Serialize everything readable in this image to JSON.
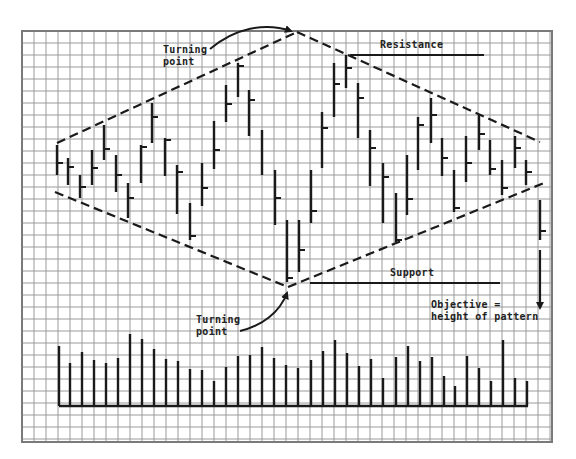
{
  "colors": {
    "grid": "#9a9a9a",
    "ink": "#1a1a1a",
    "background": "#ffffff"
  },
  "grid": {
    "left": 22,
    "top": 31,
    "right": 552,
    "bottom": 442,
    "cell": 12
  },
  "labels": {
    "turning_point_top_line1": "Turning",
    "turning_point_top_line2": "point",
    "resistance": "Resistance",
    "support": "Support",
    "turning_point_bottom_line1": "Turning",
    "turning_point_bottom_line2": "point",
    "objective_line1": "Objective =",
    "objective_line2": "height of pattern"
  },
  "chart_data": {
    "type": "bar",
    "xlabel": "",
    "ylabel": "",
    "grid": true,
    "price_bars": [
      {
        "x": 57,
        "high": 145,
        "low": 175,
        "close": 163
      },
      {
        "x": 68,
        "high": 158,
        "low": 185,
        "close": 167
      },
      {
        "x": 80,
        "high": 175,
        "low": 198,
        "close": 187
      },
      {
        "x": 92,
        "high": 150,
        "low": 185,
        "close": 168
      },
      {
        "x": 104,
        "high": 125,
        "low": 160,
        "close": 149
      },
      {
        "x": 116,
        "high": 155,
        "low": 192,
        "close": 175
      },
      {
        "x": 128,
        "high": 183,
        "low": 218,
        "close": 198
      },
      {
        "x": 141,
        "high": 145,
        "low": 183,
        "close": 147
      },
      {
        "x": 152,
        "high": 103,
        "low": 143,
        "close": 117
      },
      {
        "x": 165,
        "high": 138,
        "low": 176,
        "close": 140
      },
      {
        "x": 177,
        "high": 165,
        "low": 214,
        "close": 172
      },
      {
        "x": 190,
        "high": 203,
        "low": 240,
        "close": 236
      },
      {
        "x": 202,
        "high": 163,
        "low": 206,
        "close": 188
      },
      {
        "x": 214,
        "high": 121,
        "low": 169,
        "close": 150
      },
      {
        "x": 226,
        "high": 85,
        "low": 122,
        "close": 104
      },
      {
        "x": 238,
        "high": 63,
        "low": 97,
        "close": 66
      },
      {
        "x": 249,
        "high": 90,
        "low": 136,
        "close": 100
      },
      {
        "x": 262,
        "high": 130,
        "low": 175,
        "close": null
      },
      {
        "x": 275,
        "high": 170,
        "low": 225,
        "close": 198
      },
      {
        "x": 287,
        "high": 220,
        "low": 282,
        "close": 278
      },
      {
        "x": 299,
        "high": 220,
        "low": 272,
        "close": 250
      },
      {
        "x": 311,
        "high": 170,
        "low": 223,
        "close": 211
      },
      {
        "x": 322,
        "high": 112,
        "low": 168,
        "close": 128
      },
      {
        "x": 334,
        "high": 63,
        "low": 117,
        "close": 84
      },
      {
        "x": 346,
        "high": 55,
        "low": 88,
        "close": 68
      },
      {
        "x": 358,
        "high": 83,
        "low": 138,
        "close": 98
      },
      {
        "x": 370,
        "high": 130,
        "low": 186,
        "close": 148
      },
      {
        "x": 383,
        "high": 163,
        "low": 223,
        "close": 177
      },
      {
        "x": 396,
        "high": 193,
        "low": 242,
        "close": 240
      },
      {
        "x": 407,
        "high": 155,
        "low": 215,
        "close": 199
      },
      {
        "x": 418,
        "high": 117,
        "low": 170,
        "close": 125
      },
      {
        "x": 431,
        "high": 98,
        "low": 143,
        "close": 115
      },
      {
        "x": 442,
        "high": 138,
        "low": 176,
        "close": 158
      },
      {
        "x": 454,
        "high": 170,
        "low": 212,
        "close": 208
      },
      {
        "x": 466,
        "high": 136,
        "low": 182,
        "close": 163
      },
      {
        "x": 479,
        "high": 115,
        "low": 150,
        "close": 134
      },
      {
        "x": 490,
        "high": 140,
        "low": 175,
        "close": 169
      },
      {
        "x": 502,
        "high": 160,
        "low": 195,
        "close": 188
      },
      {
        "x": 515,
        "high": 136,
        "low": 168,
        "close": 148
      },
      {
        "x": 526,
        "high": 160,
        "low": 185,
        "close": 172
      },
      {
        "x": 540,
        "high": 200,
        "low": 240,
        "close": 231
      }
    ],
    "volume_baseline": 406,
    "volume_bars": [
      {
        "x": 59,
        "top": 346
      },
      {
        "x": 70,
        "top": 363
      },
      {
        "x": 82,
        "top": 352
      },
      {
        "x": 94,
        "top": 360
      },
      {
        "x": 106,
        "top": 363
      },
      {
        "x": 118,
        "top": 358
      },
      {
        "x": 130,
        "top": 334
      },
      {
        "x": 142,
        "top": 339
      },
      {
        "x": 154,
        "top": 349
      },
      {
        "x": 166,
        "top": 359
      },
      {
        "x": 178,
        "top": 361
      },
      {
        "x": 190,
        "top": 369
      },
      {
        "x": 202,
        "top": 370
      },
      {
        "x": 214,
        "top": 381
      },
      {
        "x": 226,
        "top": 367
      },
      {
        "x": 238,
        "top": 356
      },
      {
        "x": 250,
        "top": 355
      },
      {
        "x": 262,
        "top": 347
      },
      {
        "x": 274,
        "top": 358
      },
      {
        "x": 286,
        "top": 365
      },
      {
        "x": 298,
        "top": 368
      },
      {
        "x": 311,
        "top": 360
      },
      {
        "x": 323,
        "top": 351
      },
      {
        "x": 335,
        "top": 340
      },
      {
        "x": 347,
        "top": 353
      },
      {
        "x": 359,
        "top": 366
      },
      {
        "x": 371,
        "top": 359
      },
      {
        "x": 383,
        "top": 378
      },
      {
        "x": 396,
        "top": 357
      },
      {
        "x": 408,
        "top": 346
      },
      {
        "x": 420,
        "top": 361
      },
      {
        "x": 432,
        "top": 357
      },
      {
        "x": 444,
        "top": 376
      },
      {
        "x": 455,
        "top": 386
      },
      {
        "x": 467,
        "top": 356
      },
      {
        "x": 479,
        "top": 368
      },
      {
        "x": 491,
        "top": 381
      },
      {
        "x": 503,
        "top": 340
      },
      {
        "x": 515,
        "top": 378
      },
      {
        "x": 527,
        "top": 381
      }
    ],
    "trendlines": {
      "upper_left": {
        "x1": 57,
        "y1": 143,
        "x2": 297,
        "y2": 32
      },
      "upper_right": {
        "x1": 297,
        "y1": 32,
        "x2": 540,
        "y2": 142
      },
      "lower_left": {
        "x1": 55,
        "y1": 192,
        "x2": 288,
        "y2": 287
      },
      "lower_right": {
        "x1": 288,
        "y1": 287,
        "x2": 544,
        "y2": 183
      }
    },
    "resistance_line": {
      "x1": 350,
      "x2": 484,
      "y": 55
    },
    "support_line": {
      "x1": 310,
      "x2": 500,
      "y": 283
    },
    "objective_arrow": {
      "x": 540,
      "y1": 250,
      "y2": 308
    },
    "annotations": [
      "Turning point (top)",
      "Resistance",
      "Support",
      "Turning point (bottom)",
      "Objective = height of pattern"
    ]
  }
}
